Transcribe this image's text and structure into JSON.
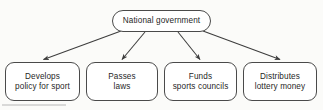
{
  "diagram": {
    "type": "hierarchy-flowchart",
    "orientation": "top-down",
    "colors": {
      "background": "#fbfbf9",
      "node_fill": "#ffffff",
      "node_border": "#4a4a4a",
      "text": "#1f1f1f",
      "arrow": "#3d3d3d"
    },
    "root": {
      "id": "national-government",
      "lines": [
        "National government"
      ]
    },
    "leaves": [
      {
        "id": "develops-policy-for-sport",
        "lines": [
          "Develops",
          "policy for sport"
        ]
      },
      {
        "id": "passes-laws",
        "lines": [
          "Passes",
          "laws"
        ]
      },
      {
        "id": "funds-sports-councils",
        "lines": [
          "Funds",
          "sports councils"
        ]
      },
      {
        "id": "distributes-lottery-money",
        "lines": [
          "Distributes",
          "lottery money"
        ]
      }
    ],
    "edges": [
      {
        "from": "national-government",
        "to": "develops-policy-for-sport",
        "arrow": "open-head"
      },
      {
        "from": "national-government",
        "to": "passes-laws",
        "arrow": "open-head"
      },
      {
        "from": "national-government",
        "to": "funds-sports-councils",
        "arrow": "open-head"
      },
      {
        "from": "national-government",
        "to": "distributes-lottery-money",
        "arrow": "open-head"
      }
    ]
  }
}
